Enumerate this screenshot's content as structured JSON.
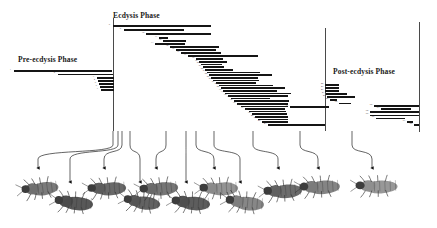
{
  "figure": {
    "width": 437,
    "height": 228,
    "background": "#ffffff",
    "bar_color": "#151515",
    "divider_color": "#4a4a4a",
    "label_color": "#1a1a1a"
  },
  "phases": [
    {
      "id": "pre-ecdysis",
      "label": "Pre-ecdysis Phase",
      "x": 18,
      "y": 55
    },
    {
      "id": "ecdysis",
      "label": "Ecdysis Phase",
      "x": 113,
      "y": 11
    },
    {
      "id": "post-ecdysis",
      "label": "Post-ecdysis Phase",
      "x": 333,
      "y": 67
    }
  ],
  "dividers": [
    {
      "id": "divider-pre-ecdysis-end",
      "x": 113,
      "y": 18,
      "height": 113
    },
    {
      "id": "divider-ecdysis-end",
      "x": 325,
      "y": 28,
      "height": 103
    },
    {
      "id": "divider-post-ecdysis-end",
      "x": 419,
      "y": 22,
      "height": 110
    }
  ],
  "chart_data": {
    "type": "bar",
    "orientation": "horizontal",
    "subtitle": "Cascading behaviour bouts across pre-ecdysis, ecdysis and post-ecdysis phases",
    "xlabel": "Time",
    "ylabel": "Behaviour",
    "grid": false,
    "legend": false,
    "xlim": [
      0,
      437
    ],
    "note": "Each bar is one behaviour bout; x is start time in px, width is duration in px, y is the row baseline in px.",
    "categories": [
      "1",
      "2",
      "3",
      "4",
      "5",
      "6",
      "7",
      "8",
      "9",
      "10",
      "11",
      "12",
      "13",
      "14",
      "15",
      "16",
      "17",
      "18",
      "19",
      "20",
      "21",
      "22",
      "23",
      "24",
      "25",
      "26",
      "27",
      "28",
      "29",
      "30",
      "31",
      "32",
      "33",
      "34",
      "35",
      "36",
      "37",
      "38",
      "39",
      "40",
      "41",
      "42",
      "43",
      "44",
      "45",
      "46",
      "47",
      "48",
      "49",
      "50",
      "51",
      "52",
      "53",
      "54",
      "55",
      "56",
      "57",
      "58",
      "59",
      "60",
      "61",
      "62",
      "63",
      "64",
      "65",
      "66"
    ],
    "bars": [
      {
        "row": 1,
        "start": 14,
        "width": 98,
        "y": 70.0,
        "h": 1.6
      },
      {
        "row": 2,
        "start": 58,
        "width": 55,
        "y": 73.6,
        "h": 1.4
      },
      {
        "row": 3,
        "start": 97,
        "width": 17,
        "y": 77.0,
        "h": 1.5
      },
      {
        "row": 4,
        "start": 98,
        "width": 16,
        "y": 80.0,
        "h": 1.5
      },
      {
        "row": 5,
        "start": 99,
        "width": 15,
        "y": 83.0,
        "h": 1.5
      },
      {
        "row": 6,
        "start": 100,
        "width": 14,
        "y": 86.0,
        "h": 1.5
      },
      {
        "row": 7,
        "start": 101,
        "width": 13,
        "y": 89.0,
        "h": 1.5
      },
      {
        "row": 8,
        "start": 113,
        "width": 98,
        "y": 25.0,
        "h": 1.8
      },
      {
        "row": 9,
        "start": 124,
        "width": 60,
        "y": 29.4,
        "h": 1.6
      },
      {
        "row": 10,
        "start": 146,
        "width": 65,
        "y": 33.2,
        "h": 1.6
      },
      {
        "row": 11,
        "start": 159,
        "width": 9,
        "y": 37.0,
        "h": 1.6
      },
      {
        "row": 12,
        "start": 163,
        "width": 23,
        "y": 40.0,
        "h": 1.6
      },
      {
        "row": 13,
        "start": 155,
        "width": 30,
        "y": 43.0,
        "h": 1.6
      },
      {
        "row": 14,
        "start": 170,
        "width": 49,
        "y": 46.0,
        "h": 1.6
      },
      {
        "row": 15,
        "start": 176,
        "width": 40,
        "y": 49.0,
        "h": 1.6
      },
      {
        "row": 16,
        "start": 181,
        "width": 40,
        "y": 52.0,
        "h": 1.6
      },
      {
        "row": 17,
        "start": 188,
        "width": 70,
        "y": 55.0,
        "h": 1.7
      },
      {
        "row": 18,
        "start": 196,
        "width": 27,
        "y": 58.2,
        "h": 1.6
      },
      {
        "row": 19,
        "start": 199,
        "width": 28,
        "y": 61.0,
        "h": 1.6
      },
      {
        "row": 20,
        "start": 201,
        "width": 21,
        "y": 63.8,
        "h": 1.6
      },
      {
        "row": 21,
        "start": 203,
        "width": 21,
        "y": 66.4,
        "h": 1.6
      },
      {
        "row": 22,
        "start": 205,
        "width": 28,
        "y": 69.0,
        "h": 1.6
      },
      {
        "row": 23,
        "start": 207,
        "width": 53,
        "y": 71.6,
        "h": 1.6
      },
      {
        "row": 24,
        "start": 209,
        "width": 63,
        "y": 74.2,
        "h": 1.6
      },
      {
        "row": 25,
        "start": 211,
        "width": 47,
        "y": 77.0,
        "h": 1.6
      },
      {
        "row": 26,
        "start": 213,
        "width": 46,
        "y": 79.6,
        "h": 1.6
      },
      {
        "row": 27,
        "start": 216,
        "width": 40,
        "y": 82.2,
        "h": 1.6
      },
      {
        "row": 28,
        "start": 219,
        "width": 54,
        "y": 84.8,
        "h": 1.6
      },
      {
        "row": 29,
        "start": 221,
        "width": 64,
        "y": 87.4,
        "h": 1.6
      },
      {
        "row": 30,
        "start": 223,
        "width": 54,
        "y": 90.0,
        "h": 1.6
      },
      {
        "row": 31,
        "start": 225,
        "width": 66,
        "y": 92.6,
        "h": 1.6
      },
      {
        "row": 32,
        "start": 228,
        "width": 60,
        "y": 95.2,
        "h": 1.6
      },
      {
        "row": 33,
        "start": 231,
        "width": 39,
        "y": 97.8,
        "h": 1.6
      },
      {
        "row": 34,
        "start": 234,
        "width": 55,
        "y": 100.4,
        "h": 1.6
      },
      {
        "row": 35,
        "start": 237,
        "width": 51,
        "y": 103.0,
        "h": 1.6
      },
      {
        "row": 36,
        "start": 241,
        "width": 47,
        "y": 105.6,
        "h": 1.6
      },
      {
        "row": 37,
        "start": 245,
        "width": 40,
        "y": 108.2,
        "h": 1.6
      },
      {
        "row": 38,
        "start": 249,
        "width": 37,
        "y": 110.8,
        "h": 1.6
      },
      {
        "row": 39,
        "start": 252,
        "width": 35,
        "y": 113.4,
        "h": 1.6
      },
      {
        "row": 40,
        "start": 255,
        "width": 33,
        "y": 116.0,
        "h": 1.6
      },
      {
        "row": 41,
        "start": 258,
        "width": 30,
        "y": 118.6,
        "h": 1.6
      },
      {
        "row": 42,
        "start": 262,
        "width": 26,
        "y": 121.2,
        "h": 1.6
      },
      {
        "row": 43,
        "start": 268,
        "width": 57,
        "y": 124.0,
        "h": 1.6
      },
      {
        "row": 44,
        "start": 325,
        "width": 14,
        "y": 84.0,
        "h": 1.5
      },
      {
        "row": 45,
        "start": 325,
        "width": 14,
        "y": 87.0,
        "h": 1.5
      },
      {
        "row": 46,
        "start": 325,
        "width": 14,
        "y": 90.0,
        "h": 1.5
      },
      {
        "row": 47,
        "start": 326,
        "width": 21,
        "y": 93.0,
        "h": 1.5
      },
      {
        "row": 48,
        "start": 327,
        "width": 28,
        "y": 96.2,
        "h": 1.5
      },
      {
        "row": 49,
        "start": 330,
        "width": 7,
        "y": 99.4,
        "h": 1.5
      },
      {
        "row": 50,
        "start": 339,
        "width": 12,
        "y": 102.6,
        "h": 1.5
      },
      {
        "row": 51,
        "start": 290,
        "width": 39,
        "y": 106.0,
        "h": 1.5
      },
      {
        "row": 52,
        "start": 374,
        "width": 45,
        "y": 105.0,
        "h": 1.6
      },
      {
        "row": 53,
        "start": 381,
        "width": 30,
        "y": 108.2,
        "h": 1.6
      },
      {
        "row": 54,
        "start": 370,
        "width": 49,
        "y": 111.4,
        "h": 1.6
      },
      {
        "row": 55,
        "start": 370,
        "width": 49,
        "y": 114.6,
        "h": 1.6
      },
      {
        "row": 56,
        "start": 376,
        "width": 29,
        "y": 117.8,
        "h": 1.6
      },
      {
        "row": 57,
        "start": 407,
        "width": 6,
        "y": 121.0,
        "h": 1.6
      },
      {
        "row": 58,
        "start": 414,
        "width": 5,
        "y": 124.0,
        "h": 1.6
      }
    ]
  },
  "leaders": [
    {
      "id": "leader-1",
      "top_x": 113,
      "top_y": 131,
      "bottom_x": 38,
      "bottom_y": 172
    },
    {
      "id": "leader-2",
      "top_x": 118,
      "top_y": 131,
      "bottom_x": 70,
      "bottom_y": 186
    },
    {
      "id": "leader-3",
      "top_x": 122,
      "top_y": 131,
      "bottom_x": 104,
      "bottom_y": 172
    },
    {
      "id": "leader-4",
      "top_x": 130,
      "top_y": 131,
      "bottom_x": 140,
      "bottom_y": 186
    },
    {
      "id": "leader-5",
      "top_x": 166,
      "top_y": 131,
      "bottom_x": 156,
      "bottom_y": 172
    },
    {
      "id": "leader-6",
      "top_x": 186,
      "top_y": 131,
      "bottom_x": 186,
      "bottom_y": 186
    },
    {
      "id": "leader-7",
      "top_x": 196,
      "top_y": 131,
      "bottom_x": 214,
      "bottom_y": 172
    },
    {
      "id": "leader-8",
      "top_x": 214,
      "top_y": 131,
      "bottom_x": 240,
      "bottom_y": 186
    },
    {
      "id": "leader-9",
      "top_x": 253,
      "top_y": 131,
      "bottom_x": 278,
      "bottom_y": 172
    },
    {
      "id": "leader-10",
      "top_x": 300,
      "top_y": 131,
      "bottom_x": 318,
      "bottom_y": 172
    },
    {
      "id": "leader-11",
      "top_x": 352,
      "top_y": 131,
      "bottom_x": 372,
      "bottom_y": 172
    }
  ],
  "specimens": [
    {
      "id": "specimen-1",
      "name": "nymph-dorsal-intact",
      "x": 22,
      "y": 176,
      "w": 40,
      "h": 24,
      "rot": -8,
      "tone": "#6f6f6f"
    },
    {
      "id": "specimen-2",
      "name": "nymph-splitting-cuticle",
      "x": 55,
      "y": 190,
      "w": 42,
      "h": 25,
      "rot": 4,
      "tone": "#4a4a4a"
    },
    {
      "id": "specimen-3",
      "name": "nymph-head-emerging",
      "x": 88,
      "y": 176,
      "w": 42,
      "h": 24,
      "rot": -4,
      "tone": "#5c5c5c"
    },
    {
      "id": "specimen-4",
      "name": "nymph-thorax-emerging",
      "x": 124,
      "y": 190,
      "w": 40,
      "h": 24,
      "rot": 6,
      "tone": "#555555"
    },
    {
      "id": "specimen-5",
      "name": "nymph-legs-free",
      "x": 140,
      "y": 176,
      "w": 42,
      "h": 24,
      "rot": -6,
      "tone": "#6a6a6a"
    },
    {
      "id": "specimen-6",
      "name": "nymph-abdomen-emerging",
      "x": 172,
      "y": 190,
      "w": 42,
      "h": 25,
      "rot": 3,
      "tone": "#4f4f4f"
    },
    {
      "id": "specimen-7",
      "name": "teneral-pale-body",
      "x": 200,
      "y": 176,
      "w": 42,
      "h": 24,
      "rot": -3,
      "tone": "#8a8a8a"
    },
    {
      "id": "specimen-8",
      "name": "teneral-expanding",
      "x": 226,
      "y": 190,
      "w": 42,
      "h": 25,
      "rot": 5,
      "tone": "#7d7d7d"
    },
    {
      "id": "specimen-9",
      "name": "teneral-upright",
      "x": 264,
      "y": 178,
      "w": 42,
      "h": 25,
      "rot": -5,
      "tone": "#606060"
    },
    {
      "id": "specimen-10",
      "name": "post-ecdysis-sclerotised",
      "x": 300,
      "y": 174,
      "w": 44,
      "h": 25,
      "rot": -4,
      "tone": "#7a7a7a"
    },
    {
      "id": "specimen-11",
      "name": "post-ecdysis-hardened",
      "x": 356,
      "y": 174,
      "w": 46,
      "h": 24,
      "rot": -2,
      "tone": "#8f8f8f"
    }
  ]
}
